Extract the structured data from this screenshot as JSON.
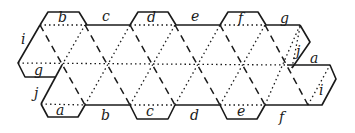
{
  "figure": {
    "top_edge_labels": [
      "b",
      "c",
      "d",
      "e",
      "f",
      "g"
    ],
    "bottom_edge_labels": [
      "a",
      "b",
      "c",
      "d",
      "e",
      "f"
    ],
    "left_flap_labels": [
      "i",
      "g",
      "j"
    ],
    "right_flap_labels": [
      "j",
      "a",
      "i"
    ],
    "labels": {
      "top_b": "b",
      "top_c": "c",
      "top_d": "d",
      "top_e": "e",
      "top_f": "f",
      "top_g": "g",
      "left_i": "i",
      "left_g": "g",
      "left_j": "j",
      "bottom_a": "a",
      "bottom_b": "b",
      "bottom_c": "c",
      "bottom_d": "d",
      "bottom_e": "e",
      "bottom_f": "f",
      "right_j": "j",
      "right_a": "a",
      "right_i": "i"
    },
    "line_styles": {
      "cut": "solid",
      "mountain_fold": "dashed",
      "valley_fold": "dotted"
    },
    "colors": {
      "ink": "#1a1a1a",
      "paper": "#ffffff"
    }
  }
}
